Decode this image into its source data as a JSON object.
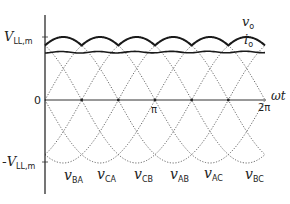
{
  "chart_data": {
    "type": "line",
    "title": "",
    "xlabel": "ωt",
    "ylabel": "",
    "x_ticks": [
      {
        "label": "0",
        "value": 0
      },
      {
        "label": "π",
        "value": 3.14159
      },
      {
        "label": "2π",
        "value": 6.28318
      }
    ],
    "y_ticks": [
      {
        "label": "V_LL,m",
        "value": 1
      },
      {
        "label": "0",
        "value": 0
      },
      {
        "label": "-V_LL,m",
        "value": -1
      }
    ],
    "xlim": [
      0,
      6.28318
    ],
    "ylim": [
      -1,
      1
    ],
    "grid": false,
    "series": [
      {
        "name": "v_BA",
        "style": "dotted",
        "phase_deg": 0
      },
      {
        "name": "v_CA",
        "style": "dotted",
        "phase_deg": 60
      },
      {
        "name": "v_CB",
        "style": "dotted",
        "phase_deg": 120
      },
      {
        "name": "v_AB",
        "style": "dotted",
        "phase_deg": 180
      },
      {
        "name": "v_AC",
        "style": "dotted",
        "phase_deg": 240
      },
      {
        "name": "v_BC",
        "style": "dotted",
        "phase_deg": 300
      },
      {
        "name": "v_o",
        "style": "solid",
        "description": "six-pulse envelope, max of line-line voltages, ripple between 0.866 and 1.0 of V_LL,m"
      },
      {
        "name": "i_o",
        "style": "solid",
        "description": "nearly constant DC current, approx 0.8 of V_LL,m scale"
      }
    ],
    "annotations": [
      "v_o",
      "i_o"
    ]
  },
  "labels": {
    "y_max": "V",
    "y_max_sub": "LL,m",
    "y_min_prefix": "-",
    "y_min": "V",
    "y_min_sub": "LL,m",
    "zero": "0",
    "pi": "π",
    "two_pi": "2π",
    "x_axis": "ωt",
    "vo": "v",
    "vo_sub": "o",
    "io": "i",
    "io_sub": "o",
    "bottom": [
      {
        "main": "v",
        "sub": "BA"
      },
      {
        "main": "v",
        "sub": "CA"
      },
      {
        "main": "v",
        "sub": "CB"
      },
      {
        "main": "v",
        "sub": "AB"
      },
      {
        "main": "v",
        "sub": "AC"
      },
      {
        "main": "v",
        "sub": "BC"
      }
    ]
  }
}
